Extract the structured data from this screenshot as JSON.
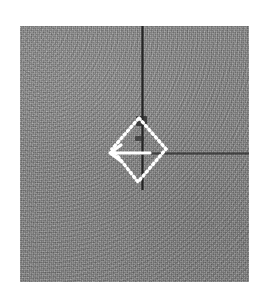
{
  "figure": {
    "domain_kind": "grayscale-micrograph",
    "canvas": {
      "width_px": 267,
      "height_px": 303,
      "background_hex": "#ffffff"
    },
    "plate": {
      "label": "grayscale image plate",
      "left_px": 20,
      "top_px": 26,
      "width_px": 229,
      "height_px": 256,
      "background_hex": "#8b8b8b",
      "texture": "fine random grain / halftone noise"
    },
    "features": [
      {
        "id": "vertical-line",
        "label": "dark vertical linear feature",
        "color_hex": "#1c1c1c",
        "orientation": "vertical",
        "enters_from": "top edge",
        "terminates": "just below the diamond marker"
      },
      {
        "id": "horizontal-line",
        "label": "dark horizontal linear feature",
        "color_hex": "#2d2d2d",
        "orientation": "horizontal",
        "starts_at": "diamond marker centre",
        "extends_to": "right edge of plate"
      },
      {
        "id": "dark-node",
        "label": "dark rectangular node at feature junction",
        "color_hex": "#2a2a2a"
      }
    ],
    "annotations": [
      {
        "id": "diamond-marker",
        "label": "dotted diamond region-of-interest marker",
        "shape": "diamond",
        "style": "dotted outline",
        "color_hex": "#ffffff",
        "centre_x_px": 142,
        "centre_y_px": 153,
        "half_width_px": 27,
        "half_height_px": 31
      },
      {
        "id": "arrow-marker",
        "label": "white arrow pointing left",
        "shape": "arrow",
        "direction": "left",
        "color_hex": "#ffffff",
        "tip_x_px": 116,
        "tip_y_px": 153,
        "tail_x_px": 148,
        "tail_y_px": 153
      }
    ]
  }
}
